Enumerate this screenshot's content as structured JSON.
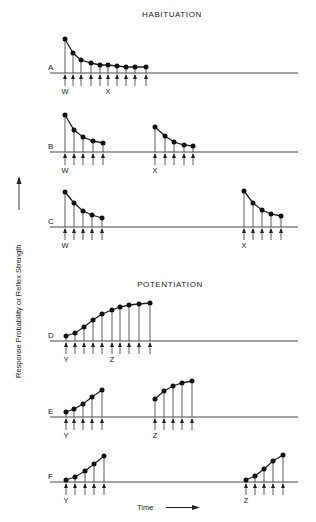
{
  "titles": {
    "habituation": "HABITUATION",
    "potentiation": "POTENTIATION"
  },
  "axes": {
    "ylabel": "Response Probability or Reflex Strength",
    "xlabel": "Time"
  },
  "chart_data": {
    "type": "diagram",
    "rows": [
      {
        "label": "A",
        "section": "habituation",
        "baseline_y": 73,
        "groups": [
          {
            "stimuli_labels": [
              {
                "text": "W",
                "index": 0
              },
              {
                "text": "X",
                "index": 5
              }
            ],
            "x": [
              65,
              73,
              81,
              91,
              100,
              108,
              117,
              126,
              135,
              146
            ],
            "y": [
              39,
              53,
              60,
              63,
              65,
              65,
              66,
              67,
              67,
              67
            ]
          }
        ]
      },
      {
        "label": "B",
        "section": "habituation",
        "baseline_y": 152,
        "groups": [
          {
            "stimuli_labels": [
              {
                "text": "W",
                "index": 0
              }
            ],
            "x": [
              65,
              74,
              83,
              93,
              103
            ],
            "y": [
              115,
              130,
              137,
              141,
              143
            ]
          },
          {
            "stimuli_labels": [
              {
                "text": "X",
                "index": 0
              }
            ],
            "x": [
              155,
              165,
              174,
              184,
              193
            ],
            "y": [
              127,
              136,
              142,
              145,
              146
            ]
          }
        ]
      },
      {
        "label": "C",
        "section": "habituation",
        "baseline_y": 227,
        "groups": [
          {
            "stimuli_labels": [
              {
                "text": "W",
                "index": 0
              }
            ],
            "x": [
              65,
              74,
              83,
              92,
              102
            ],
            "y": [
              192,
              203,
              211,
              215,
              218
            ]
          },
          {
            "stimuli_labels": [
              {
                "text": "X",
                "index": 0
              }
            ],
            "x": [
              244,
              253,
              262,
              271,
              281
            ],
            "y": [
              191,
              203,
              210,
              214,
              216
            ]
          }
        ]
      },
      {
        "label": "D",
        "section": "potentiation",
        "baseline_y": 341,
        "groups": [
          {
            "stimuli_labels": [
              {
                "text": "Y",
                "index": 0
              },
              {
                "text": "Z",
                "index": 5
              }
            ],
            "x": [
              66,
              75,
              84,
              93,
              102,
              112,
              120,
              129,
              139,
              150
            ],
            "y": [
              336,
              333,
              327,
              320,
              314,
              310,
              307,
              305,
              304,
              303
            ]
          }
        ]
      },
      {
        "label": "E",
        "section": "potentiation",
        "baseline_y": 417,
        "groups": [
          {
            "stimuli_labels": [
              {
                "text": "Y",
                "index": 0
              }
            ],
            "x": [
              66,
              74,
              83,
              92,
              102
            ],
            "y": [
              412,
              409,
              404,
              397,
              390
            ]
          },
          {
            "stimuli_labels": [
              {
                "text": "Z",
                "index": 0
              }
            ],
            "x": [
              155,
              164,
              173,
              182,
              192
            ],
            "y": [
              399,
              391,
              386,
              383,
              381
            ]
          }
        ]
      },
      {
        "label": "F",
        "section": "potentiation",
        "baseline_y": 482,
        "groups": [
          {
            "stimuli_labels": [
              {
                "text": "Y",
                "index": 0
              }
            ],
            "x": [
              66,
              75,
              85,
              94,
              104
            ],
            "y": [
              480,
              477,
              471,
              464,
              456
            ]
          },
          {
            "stimuli_labels": [
              {
                "text": "Z",
                "index": 0
              }
            ],
            "x": [
              246,
              255,
              264,
              273,
              283
            ],
            "y": [
              480,
              476,
              469,
              461,
              455
            ]
          }
        ]
      }
    ]
  }
}
